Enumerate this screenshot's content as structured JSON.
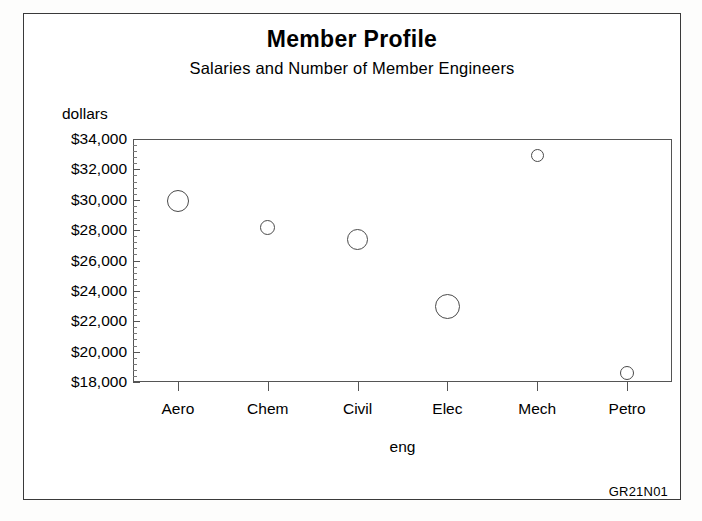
{
  "figure": {
    "title": "Member Profile",
    "subtitle": "Salaries and Number of Member Engineers",
    "footer_code": "GR21N01",
    "frame_color": "#3a3a3a",
    "axis_color": "#555555",
    "bubble_color": "#4a4a4a",
    "background": "#ffffff"
  },
  "chart_data": {
    "type": "scatter",
    "title": "Member Profile",
    "subtitle": "Salaries and Number of Member Engineers",
    "xlabel": "eng",
    "ylabel": "dollars",
    "categories": [
      "Aero",
      "Chem",
      "Civil",
      "Elec",
      "Mech",
      "Petro"
    ],
    "values": [
      29950,
      28150,
      27400,
      23000,
      32900,
      18600
    ],
    "bubble_sizes": [
      22,
      15,
      21,
      25,
      13,
      14
    ],
    "size_encodes": "Number of Member Engineers",
    "ylim": [
      18000,
      34000
    ],
    "ytick_values": [
      18000,
      20000,
      22000,
      24000,
      26000,
      28000,
      30000,
      32000,
      34000
    ],
    "ytick_labels": [
      "$18,000",
      "$20,000",
      "$22,000",
      "$24,000",
      "$26,000",
      "$28,000",
      "$30,000",
      "$32,000",
      "$34,000"
    ],
    "ytick_minor_step": 400,
    "grid": false,
    "legend": "none",
    "marker_style": "open-circle",
    "points": [
      {
        "category": "Aero",
        "salary": 29950,
        "size": 22
      },
      {
        "category": "Chem",
        "salary": 28150,
        "size": 15
      },
      {
        "category": "Civil",
        "salary": 27400,
        "size": 21
      },
      {
        "category": "Elec",
        "salary": 23000,
        "size": 25
      },
      {
        "category": "Mech",
        "salary": 32900,
        "size": 13
      },
      {
        "category": "Petro",
        "salary": 18600,
        "size": 14
      }
    ]
  }
}
